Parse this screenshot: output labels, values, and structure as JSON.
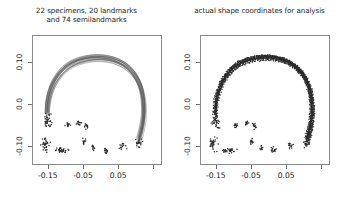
{
  "figure": {
    "panels": [
      {
        "id": "left",
        "title_line1": "22 specimens, 20 landmarks",
        "title_line2": "and 74 semilandmarks",
        "render": "curves"
      },
      {
        "id": "right",
        "title_line1": "actual shape coordinates for analysis",
        "title_line2": "",
        "render": "points"
      }
    ],
    "axes": {
      "x_ticklabels": [
        "-0.15",
        "-0.05",
        "0.05"
      ],
      "y_ticklabels": [
        "0.10",
        "0.0",
        "-0.10"
      ],
      "x_tick_values": [
        -0.15,
        -0.05,
        0.05,
        0.15
      ],
      "y_tick_values": [
        0.1,
        0.0,
        -0.1
      ],
      "xlim": [
        -0.195,
        0.175
      ],
      "ylim": [
        -0.145,
        0.165
      ],
      "frame_color": "#8a8a8a",
      "tick_color": "#6e6e6e",
      "label_color": "#1a1a1a"
    }
  },
  "chart_data": {
    "type": "scatter",
    "title": "22 specimens, 20 landmarks and 74 semilandmarks",
    "subtitle": "actual shape coordinates for analysis",
    "xlabel": "",
    "ylabel": "",
    "xlim": [
      -0.195,
      0.175
    ],
    "ylim": [
      -0.145,
      0.165
    ],
    "xticks": [
      -0.15,
      -0.05,
      0.05
    ],
    "yticks": [
      -0.1,
      0.0,
      0.1
    ],
    "grid": false,
    "legend": null,
    "n_specimens": 22,
    "n_landmarks": 20,
    "n_semilandmarks": 74,
    "outline_arch": {
      "comment": "mean semilandmark arch path in data coordinates, open at the bottom",
      "points": [
        [
          -0.152,
          -0.022
        ],
        [
          -0.15,
          0.004
        ],
        [
          -0.144,
          0.028
        ],
        [
          -0.134,
          0.05
        ],
        [
          -0.12,
          0.069
        ],
        [
          -0.103,
          0.085
        ],
        [
          -0.083,
          0.097
        ],
        [
          -0.06,
          0.105
        ],
        [
          -0.036,
          0.11
        ],
        [
          -0.011,
          0.112
        ],
        [
          0.013,
          0.111
        ],
        [
          0.036,
          0.107
        ],
        [
          0.057,
          0.1
        ],
        [
          0.076,
          0.09
        ],
        [
          0.092,
          0.077
        ],
        [
          0.105,
          0.061
        ],
        [
          0.115,
          0.042
        ],
        [
          0.121,
          0.021
        ],
        [
          0.124,
          -0.001
        ],
        [
          0.124,
          -0.024
        ],
        [
          0.121,
          -0.046
        ],
        [
          0.116,
          -0.066
        ],
        [
          0.11,
          -0.084
        ]
      ]
    },
    "landmark_clusters": [
      {
        "name": "left-anterior",
        "center": [
          -0.15,
          -0.04
        ],
        "spread": [
          0.012,
          0.018
        ],
        "n": 40
      },
      {
        "name": "left-lower",
        "center": [
          -0.158,
          -0.095
        ],
        "spread": [
          0.013,
          0.016
        ],
        "n": 36
      },
      {
        "name": "mid-lower-bar",
        "center": [
          -0.112,
          -0.11
        ],
        "spread": [
          0.022,
          0.006
        ],
        "n": 34
      },
      {
        "name": "mid-left-small",
        "center": [
          -0.092,
          -0.05
        ],
        "spread": [
          0.008,
          0.007
        ],
        "n": 14
      },
      {
        "name": "mid-center-a",
        "center": [
          -0.062,
          -0.046
        ],
        "spread": [
          0.007,
          0.006
        ],
        "n": 12
      },
      {
        "name": "mid-center-b",
        "center": [
          -0.04,
          -0.052
        ],
        "spread": [
          0.008,
          0.007
        ],
        "n": 14
      },
      {
        "name": "mid-center-c",
        "center": [
          -0.048,
          -0.088
        ],
        "spread": [
          0.007,
          0.008
        ],
        "n": 12
      },
      {
        "name": "mid-center-d",
        "center": [
          -0.02,
          -0.105
        ],
        "spread": [
          0.006,
          0.007
        ],
        "n": 10
      },
      {
        "name": "right-lower",
        "center": [
          0.016,
          -0.11
        ],
        "spread": [
          0.009,
          0.008
        ],
        "n": 16
      },
      {
        "name": "right-mid",
        "center": [
          0.062,
          -0.1
        ],
        "spread": [
          0.01,
          0.008
        ],
        "n": 14
      },
      {
        "name": "right-tip",
        "center": [
          0.108,
          -0.092
        ],
        "spread": [
          0.011,
          0.01
        ],
        "n": 22
      }
    ],
    "series": [
      {
        "name": "specimen curves",
        "n": 22,
        "style": "thin gray outline"
      },
      {
        "name": "shape coordinates",
        "n": 94,
        "style": "black dots"
      }
    ]
  }
}
